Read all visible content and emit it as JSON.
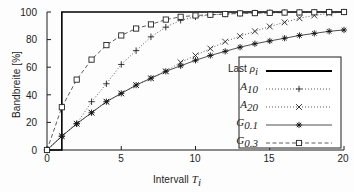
{
  "chart_data": {
    "type": "line",
    "title": "",
    "xlabel": "Intervall T_i",
    "ylabel": "Bandbreite [%]",
    "xlim": [
      0,
      20
    ],
    "ylim": [
      0,
      100
    ],
    "xticks": [
      0,
      5,
      10,
      15,
      20
    ],
    "yticks": [
      0,
      20,
      40,
      60,
      80,
      100
    ],
    "grid": false,
    "legend_position": "lower right",
    "x": [
      0,
      1,
      2,
      3,
      4,
      5,
      6,
      7,
      8,
      9,
      10,
      11,
      12,
      13,
      14,
      15,
      16,
      17,
      18,
      19,
      20
    ],
    "series": [
      {
        "name": "Last ρᵢ",
        "style": "solid-step",
        "marker": "none",
        "color": "#000000",
        "values": [
          0,
          100,
          100,
          100,
          100,
          100,
          100,
          100,
          100,
          100,
          100,
          100,
          100,
          100,
          100,
          100,
          100,
          100,
          100,
          100,
          100
        ]
      },
      {
        "name": "A₁₀",
        "style": "dotted",
        "marker": "plus",
        "color": "#333333",
        "values": [
          0,
          10,
          19,
          35,
          48,
          62,
          72,
          82,
          89,
          94,
          96.5,
          98,
          98.5,
          99,
          99.3,
          99.5,
          99.7,
          99.8,
          99.9,
          100,
          100
        ]
      },
      {
        "name": "A₂₀",
        "style": "dotted",
        "marker": "cross",
        "color": "#333333",
        "values": [
          0,
          10,
          19,
          27,
          35,
          41,
          47,
          52,
          57,
          63.5,
          68.5,
          73.5,
          78.5,
          82.5,
          86,
          89.5,
          92.5,
          95.5,
          97.5,
          99,
          100
        ]
      },
      {
        "name": "G₀.₁",
        "style": "solid",
        "marker": "star",
        "color": "#222222",
        "values": [
          0,
          10,
          19,
          27,
          35,
          41,
          47,
          52,
          57,
          61,
          65,
          68.5,
          71.5,
          74.5,
          77,
          79,
          81,
          83,
          84.5,
          86,
          87
        ]
      },
      {
        "name": "G₀.₃",
        "style": "dashed",
        "marker": "square",
        "color": "#333333",
        "values": [
          0,
          31,
          51,
          65.5,
          76,
          83,
          88,
          91,
          94.5,
          96.5,
          97.5,
          98,
          98.5,
          99,
          99.2,
          99.4,
          99.6,
          99.7,
          99.8,
          99.9,
          100
        ]
      }
    ]
  },
  "axes": {
    "ylabel_text": "Bandbreite [%]",
    "xlabel_prefix": "Intervall ",
    "xlabel_symbol": "T",
    "xlabel_subscript": "i",
    "yticklabels": [
      "0",
      "20",
      "40",
      "60",
      "80",
      "100"
    ],
    "xticklabels": [
      "0",
      "5",
      "10",
      "15",
      "20"
    ]
  },
  "legend": {
    "entries": [
      {
        "label_main": "Last ",
        "label_sym": "ρ",
        "label_sub": "i",
        "key": "last-rho"
      },
      {
        "label_main": "",
        "label_sym": "A",
        "label_sub": "10",
        "key": "a10"
      },
      {
        "label_main": "",
        "label_sym": "A",
        "label_sub": "20",
        "key": "a20"
      },
      {
        "label_main": "",
        "label_sym": "G",
        "label_sub": "0.1",
        "key": "g01"
      },
      {
        "label_main": "",
        "label_sym": "G",
        "label_sub": "0.3",
        "key": "g03"
      }
    ]
  },
  "colors": {
    "axis": "#1c1c1c",
    "series_main": "#000000",
    "background": "#fdfdfd"
  }
}
